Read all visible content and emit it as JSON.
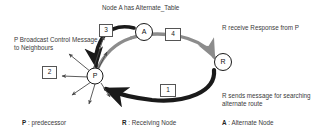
{
  "figure": {
    "title": "Node A has Alternate_Table",
    "type": "network-routing-diagram"
  },
  "captions": {
    "left": "P Broadcast Control Message to Neighbours",
    "right_top": "R receive Response from P",
    "right_bottom": "R sends message for searching alternate route"
  },
  "steps": [
    {
      "number": "1",
      "meaning": "R sends message for searching alternate route"
    },
    {
      "number": "2",
      "meaning": "P Broadcast Control Message to Neighbours"
    },
    {
      "number": "3",
      "meaning": "A responds to P"
    },
    {
      "number": "4",
      "meaning": "R receive Response from P"
    }
  ],
  "step_labels": {
    "one": "1",
    "two": "2",
    "three": "3",
    "four": "4"
  },
  "nodes": [
    {
      "id": "A",
      "label": "A",
      "role": "Alternate Node"
    },
    {
      "id": "P",
      "label": "P",
      "role": "predecessor"
    },
    {
      "id": "R",
      "label": "R",
      "role": "Receiving Node"
    }
  ],
  "node_labels": {
    "a": "A",
    "p": "P",
    "r": "R"
  },
  "legend": [
    {
      "key": "P",
      "separator": " : ",
      "value": "predecessor"
    },
    {
      "key": "R",
      "separator": " : ",
      "value": "Receiving Node"
    },
    {
      "key": "A",
      "separator": " : ",
      "value": "Alternate Node"
    }
  ],
  "legend_items": {
    "p_key": "P",
    "p_sep": " : ",
    "p_value": "predecessor",
    "r_key": "R",
    "r_sep": " : ",
    "r_value": "Receiving Node",
    "a_key": "A",
    "a_sep": " : ",
    "a_value": "Alternate Node"
  },
  "colors": {
    "dark_arc": "#1a1a1a",
    "gray_arc": "#8c8c8c",
    "thin_arrow": "#4a4a4a",
    "node_stroke": "#1a1a1a",
    "text": "#3a3a3a",
    "background": "#ffffff"
  }
}
